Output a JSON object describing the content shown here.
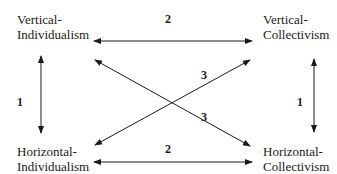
{
  "nodes": {
    "vertical_individualism": {
      "line1": "Vertical-",
      "line2": "Individualism"
    },
    "vertical_collectivism": {
      "line1": "Vertical-",
      "line2": "Collectivism"
    },
    "horizontal_individualism": {
      "line1": "Horizontal-",
      "line2": "Individualism"
    },
    "horizontal_collectivism": {
      "line1": "Horizontal-",
      "line2": "Collectivism"
    }
  },
  "edges": {
    "top_horizontal": {
      "label": "2"
    },
    "bottom_horizontal": {
      "label": "2"
    },
    "left_vertical": {
      "label": "1"
    },
    "right_vertical": {
      "label": "1"
    },
    "diagonal_up": {
      "label": "3"
    },
    "diagonal_down": {
      "label": "3"
    }
  },
  "colors": {
    "line": "#1a1a1a",
    "text": "#1a1a1a",
    "background": "#ffffff"
  }
}
